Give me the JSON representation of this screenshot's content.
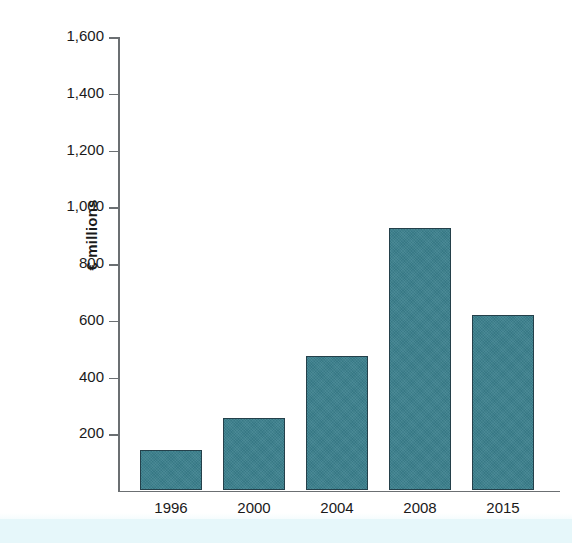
{
  "chart_data": {
    "type": "bar",
    "title": "",
    "xlabel": "",
    "ylabel": "€ millions",
    "categories": [
      "1996",
      "2000",
      "2004",
      "2008",
      "2015"
    ],
    "values": [
      140,
      252,
      472,
      920,
      615
    ],
    "ylim": [
      0,
      1600
    ],
    "yticks": [
      200,
      400,
      600,
      800,
      1000,
      1200,
      1400,
      1600
    ],
    "ytick_labels": [
      "200",
      "400",
      "600",
      "800",
      "1,000",
      "1,200",
      "1,400",
      "1,600"
    ],
    "grid": false,
    "legend": null,
    "series": [
      {
        "name": "€ millions",
        "values": [
          140,
          252,
          472,
          920,
          615
        ],
        "color": "#3a7f8c",
        "edge_color": "#24404a"
      }
    ],
    "colors": {
      "bar_fill": "#3a7f8c",
      "bar_edge": "#24404a",
      "axis": "#6b6f72",
      "text": "#1a1a1a",
      "background": "#ffffff",
      "bottom_band": "#e6f7fa"
    }
  }
}
